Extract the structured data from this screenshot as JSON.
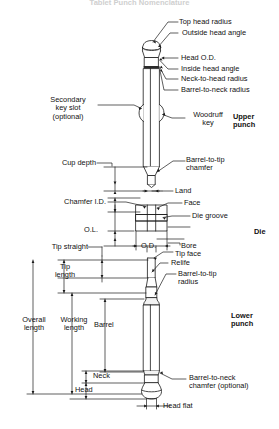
{
  "figure": {
    "title": "Tablet Punch Nomenclature",
    "sections": {
      "upper_punch": "Upper\npunch",
      "die": "Die",
      "lower_punch": "Lower\npunch"
    }
  },
  "labels": {
    "top_head_radius": "Top head radius",
    "outside_head_angle": "Outside head angle",
    "head_od": "Head O.D.",
    "inside_head_angle": "Inside head angle",
    "neck_to_head_radius": "Neck-to-head radius",
    "barrel_to_neck_radius": "Barrel-to-neck radius",
    "secondary_key_slot": "Secondary\nkey slot\n(optional)",
    "woodruff_key": "Woodruff\nkey",
    "barrel_to_tip_chamfer": "Barrel-to-tip\nchamfer",
    "cup_depth": "Cup depth",
    "land": "Land",
    "chamfer_id": "Chamfer I.D.",
    "face": "Face",
    "die_groove": "Die groove",
    "ol": "O.L.",
    "od": "O.D.",
    "bore": "Bore",
    "tip_straight": "Tip straight",
    "tip_face": "Tip face",
    "relife": "Relife",
    "barrel_to_tip_radius": "Barrel-to-tip\nradius",
    "tip_length": "Tip\nlength",
    "overall_length": "Overall\nlength",
    "working_length": "Working\nlength",
    "barrel": "Barrel",
    "neck": "Neck",
    "head": "Head",
    "head_flat": "Head flat",
    "barrel_to_neck_chamfer": "Barrel-to-neck\nchamfer (optional)"
  },
  "colors": {
    "line": "#1a1a1a",
    "fill": "#ffffff",
    "shade": "#f2f2f2",
    "title": "#cfcfcf"
  }
}
